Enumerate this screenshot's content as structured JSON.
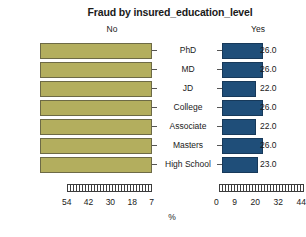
{
  "chart_data": {
    "type": "bar",
    "title": "Fraud by insured_education_level",
    "subtype": "bilateral-paired-bar",
    "categories": [
      "PhD",
      "MD",
      "JD",
      "College",
      "Associate",
      "Masters",
      "High School"
    ],
    "series": [
      {
        "name": "No",
        "values": [
          74.0,
          74.0,
          78.0,
          74.0,
          78.0,
          74.0,
          77.0
        ],
        "labels": [
          "74.0",
          "74.0",
          "78.0",
          "74.0",
          "78.0",
          "74.0",
          "77.0"
        ],
        "color": "#b3ae5e",
        "direction": "left",
        "axis_ticks": [
          "54",
          "42",
          "30",
          "18",
          "7"
        ],
        "axis_reversed": true,
        "axis_min": 0,
        "axis_max": 60
      },
      {
        "name": "Yes",
        "values": [
          26.0,
          26.0,
          22.0,
          26.0,
          22.0,
          26.0,
          23.0
        ],
        "labels": [
          "26.0",
          "26.0",
          "22.0",
          "26.0",
          "22.0",
          "26.0",
          "23.0"
        ],
        "color": "#1f4e79",
        "direction": "right",
        "axis_ticks": [
          "0",
          "9",
          "20",
          "32",
          "44"
        ],
        "axis_reversed": false,
        "axis_min": 0,
        "axis_max": 50
      }
    ],
    "xlabel": "%",
    "ylabel": "",
    "grid": false,
    "legend": "none",
    "value_labels_shown": true
  },
  "header": {
    "title": "Fraud by insured_education_level",
    "left_panel": "No",
    "right_panel": "Yes"
  },
  "axis": {
    "caption": "%",
    "left_ticks": [
      "54",
      "42",
      "30",
      "18",
      "7"
    ],
    "right_ticks": [
      "0",
      "9",
      "20",
      "32",
      "44"
    ]
  }
}
